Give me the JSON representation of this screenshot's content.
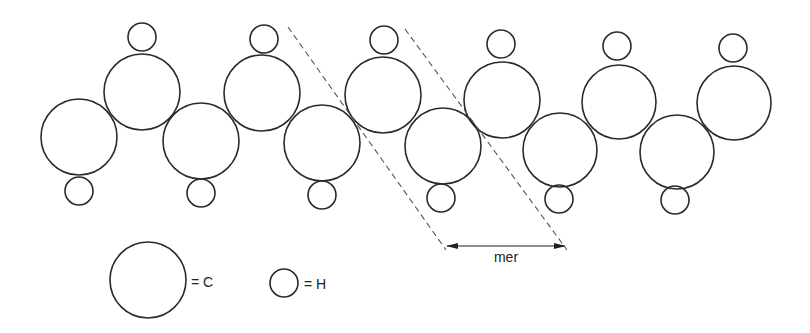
{
  "diagram": {
    "carbon_atoms": [
      {
        "cx": 79,
        "cy": 137,
        "r": 38
      },
      {
        "cx": 142,
        "cy": 92,
        "r": 38
      },
      {
        "cx": 201,
        "cy": 141,
        "r": 38
      },
      {
        "cx": 262,
        "cy": 93,
        "r": 38
      },
      {
        "cx": 322,
        "cy": 143,
        "r": 38
      },
      {
        "cx": 383,
        "cy": 95,
        "r": 38
      },
      {
        "cx": 443,
        "cy": 146,
        "r": 38
      },
      {
        "cx": 502,
        "cy": 100,
        "r": 38
      },
      {
        "cx": 560,
        "cy": 150,
        "r": 37
      },
      {
        "cx": 619,
        "cy": 102,
        "r": 37
      },
      {
        "cx": 677,
        "cy": 152,
        "r": 37
      },
      {
        "cx": 734,
        "cy": 103,
        "r": 37
      }
    ],
    "hydrogen_atoms": [
      {
        "cx": 79,
        "cy": 191,
        "r": 14
      },
      {
        "cx": 142,
        "cy": 37,
        "r": 14
      },
      {
        "cx": 201,
        "cy": 193,
        "r": 14
      },
      {
        "cx": 264,
        "cy": 39,
        "r": 14
      },
      {
        "cx": 322,
        "cy": 195,
        "r": 14
      },
      {
        "cx": 384,
        "cy": 40,
        "r": 14
      },
      {
        "cx": 441,
        "cy": 198,
        "r": 14
      },
      {
        "cx": 501,
        "cy": 44,
        "r": 14
      },
      {
        "cx": 559,
        "cy": 199,
        "r": 14
      },
      {
        "cx": 617,
        "cy": 46,
        "r": 14
      },
      {
        "cx": 675,
        "cy": 200,
        "r": 14
      },
      {
        "cx": 733,
        "cy": 48,
        "r": 14
      }
    ],
    "mer_lines": [
      {
        "x1": 288,
        "y1": 27,
        "x2": 446,
        "y2": 250
      },
      {
        "x1": 405,
        "y1": 29,
        "x2": 567,
        "y2": 250
      }
    ],
    "mer_arrow": {
      "x1": 447,
      "y1": 246,
      "x2": 565,
      "y2": 246
    },
    "mer_label": "mer",
    "legend": {
      "carbon": {
        "label": "= C",
        "cx": 148,
        "cy": 280,
        "r": 38
      },
      "hydrogen": {
        "label": "= H",
        "cx": 284,
        "cy": 283,
        "r": 14
      }
    }
  }
}
